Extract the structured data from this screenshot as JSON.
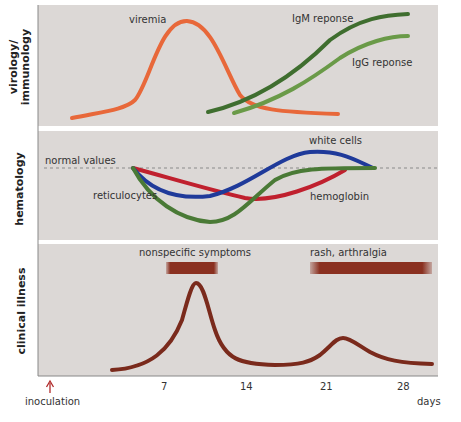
{
  "panels": {
    "virology": {
      "ylabel_line1": "virology/",
      "ylabel_line2": "immunology",
      "labels": {
        "viremia": "viremia",
        "igm": "IgM reponse",
        "igg": "IgG reponse"
      }
    },
    "hematology": {
      "ylabel": "hematology",
      "labels": {
        "normal": "normal values",
        "white_cells": "white cells",
        "reticulocytes": "reticulocytes",
        "hemoglobin": "hemoglobin"
      }
    },
    "clinical": {
      "ylabel": "clinical illness",
      "labels": {
        "nonspecific": "nonspecific symptoms",
        "rash": "rash, arthralgia"
      }
    }
  },
  "axis": {
    "ticks": [
      "7",
      "14",
      "21",
      "28"
    ],
    "unit": "days",
    "inoculation": "inoculation"
  },
  "colors": {
    "panel_bg": "#dcd8d6",
    "viremia": "#e8683a",
    "igm": "#3f6e2f",
    "igg": "#6a9a48",
    "white_cells": "#1f3a9a",
    "hemoglobin": "#c0202e",
    "reticulocytes": "#4a7a36",
    "clinical": "#7a2a1c",
    "inoculation_arrow": "#b02a2a"
  }
}
